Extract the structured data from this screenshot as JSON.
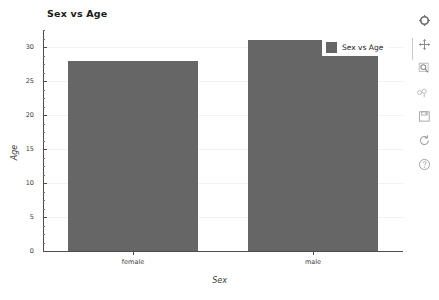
{
  "chart_data": {
    "type": "bar",
    "title": "Sex vs Age",
    "xlabel": "Sex",
    "ylabel": "Age",
    "categories": [
      "female",
      "male"
    ],
    "values": [
      28,
      31
    ],
    "series": [
      {
        "name": "Sex vs Age",
        "values": [
          28,
          31
        ]
      }
    ],
    "ylim": [
      0,
      32.5
    ],
    "yticks": [
      0,
      5,
      10,
      15,
      20,
      25,
      30
    ],
    "ytick_labels": [
      "0",
      "5",
      "10",
      "15",
      "20",
      "25",
      "30"
    ],
    "ytick_minor_step": 1.25,
    "grid": true,
    "legend": {
      "position": "upper right",
      "entries": [
        {
          "label": "Sex vs Age",
          "color": "#666666"
        }
      ]
    },
    "bar_color": "#666666"
  },
  "toolbar": {
    "buttons": [
      {
        "name": "home-icon",
        "tooltip": "Home"
      },
      {
        "name": "move-icon",
        "tooltip": "Pan"
      },
      {
        "name": "zoom-icon",
        "tooltip": "Zoom"
      },
      {
        "name": "subplots-icon",
        "tooltip": "Subplots"
      },
      {
        "name": "save-icon",
        "tooltip": "Save"
      },
      {
        "name": "refresh-icon",
        "tooltip": "Reset"
      },
      {
        "name": "help-icon",
        "tooltip": "Help"
      }
    ]
  },
  "colors": {
    "bar": "#666666",
    "axis": "#4d4d4d",
    "grid": "#f2f2f5",
    "text": "#3c3c3c",
    "background": "#ffffff"
  }
}
